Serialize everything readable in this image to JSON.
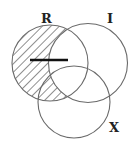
{
  "diagram": {
    "type": "venn",
    "sets": [
      {
        "id": "R",
        "label": "R"
      },
      {
        "id": "I",
        "label": "I"
      },
      {
        "id": "X",
        "label": "X"
      }
    ],
    "shaded_region": {
      "description": "R not I",
      "include": [
        "R"
      ],
      "exclude": [
        "I"
      ],
      "pattern": "diagonal-hatch"
    },
    "marks": [
      {
        "type": "bar",
        "description": "horizontal bar inside R extending into R∩I"
      }
    ],
    "colors": {
      "stroke": "#6a6a6a",
      "hatch": "#444444",
      "bar": "#111111",
      "label": "#222222"
    }
  }
}
